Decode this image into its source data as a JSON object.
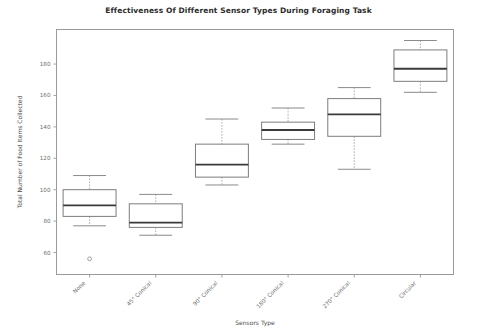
{
  "chart_data": {
    "type": "box",
    "title": "Effectiveness Of Different Sensor Types During Foraging Task",
    "xlabel": "Sensors Type",
    "ylabel": "Total Number of Food Items Collected",
    "categories": [
      "None",
      "45° Conical",
      "90° Conical",
      "180° Conical",
      "270° Conical",
      "Circular"
    ],
    "ylim": [
      46,
      202
    ],
    "yticks": [
      60,
      80,
      100,
      120,
      140,
      160,
      180
    ],
    "ytick_labels": [
      "60",
      "80",
      "100",
      "120",
      "140",
      "160",
      "180"
    ],
    "grid": false,
    "legend": null,
    "boxes": [
      {
        "category": "None",
        "whisker_low": 77,
        "q1": 83,
        "median": 90,
        "q3": 100,
        "whisker_high": 109,
        "outliers": [
          56
        ]
      },
      {
        "category": "45° Conical",
        "whisker_low": 71,
        "q1": 76,
        "median": 79,
        "q3": 91,
        "whisker_high": 97,
        "outliers": []
      },
      {
        "category": "90° Conical",
        "whisker_low": 103,
        "q1": 108,
        "median": 116,
        "q3": 129,
        "whisker_high": 145,
        "outliers": []
      },
      {
        "category": "180° Conical",
        "whisker_low": 129,
        "q1": 132,
        "median": 138,
        "q3": 143,
        "whisker_high": 152,
        "outliers": []
      },
      {
        "category": "270° Conical",
        "whisker_low": 113,
        "q1": 134,
        "median": 148,
        "q3": 158,
        "whisker_high": 165,
        "outliers": []
      },
      {
        "category": "Circular",
        "whisker_low": 162,
        "q1": 169,
        "median": 177,
        "q3": 189,
        "whisker_high": 195,
        "outliers": []
      }
    ]
  }
}
